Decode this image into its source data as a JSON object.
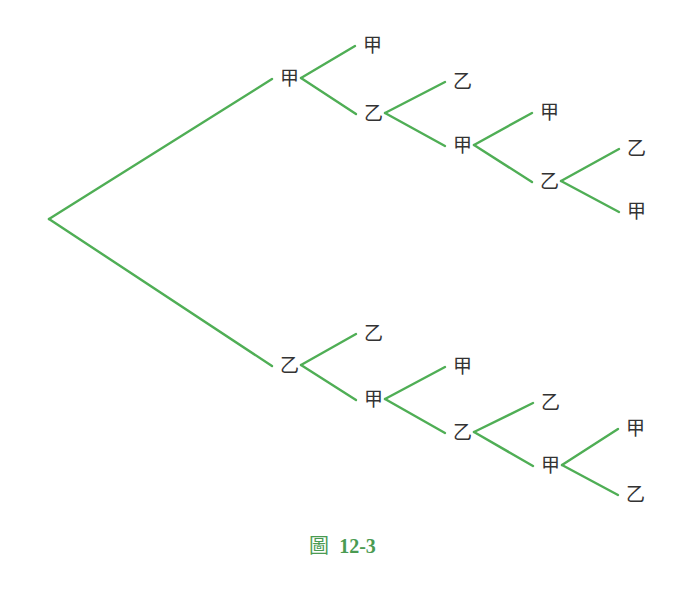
{
  "diagram": {
    "type": "tree-diagram",
    "edge_color": "#4fae55",
    "label_color": "#333333",
    "caption": {
      "prefix": "圖",
      "number": "12-3",
      "color": "#4a9b52"
    },
    "root": {
      "x": 49,
      "y": 219
    },
    "nodes": [
      {
        "id": "a",
        "label": "甲",
        "x": 289,
        "y": 78,
        "parent": "root"
      },
      {
        "id": "aa",
        "label": "甲",
        "x": 372,
        "y": 45,
        "parent": "a"
      },
      {
        "id": "ab",
        "label": "乙",
        "x": 373,
        "y": 113,
        "parent": "a"
      },
      {
        "id": "aba",
        "label": "乙",
        "x": 462,
        "y": 81,
        "parent": "ab"
      },
      {
        "id": "abb",
        "label": "甲",
        "x": 462,
        "y": 145,
        "parent": "ab"
      },
      {
        "id": "abba",
        "label": "甲",
        "x": 549,
        "y": 112,
        "parent": "abb"
      },
      {
        "id": "abbb",
        "label": "乙",
        "x": 549,
        "y": 181,
        "parent": "abb"
      },
      {
        "id": "abbba",
        "label": "乙",
        "x": 636,
        "y": 148,
        "parent": "abbb"
      },
      {
        "id": "abbbb",
        "label": "甲",
        "x": 636,
        "y": 211,
        "parent": "abbb"
      },
      {
        "id": "b",
        "label": "乙",
        "x": 289,
        "y": 365,
        "parent": "root"
      },
      {
        "id": "ba",
        "label": "乙",
        "x": 373,
        "y": 333,
        "parent": "b"
      },
      {
        "id": "bb",
        "label": "甲",
        "x": 373,
        "y": 399,
        "parent": "b"
      },
      {
        "id": "bba",
        "label": "甲",
        "x": 462,
        "y": 366,
        "parent": "bb"
      },
      {
        "id": "bbb",
        "label": "乙",
        "x": 462,
        "y": 432,
        "parent": "bb"
      },
      {
        "id": "bbba",
        "label": "乙",
        "x": 550,
        "y": 402,
        "parent": "bbb"
      },
      {
        "id": "bbbb",
        "label": "甲",
        "x": 550,
        "y": 465,
        "parent": "bbb"
      },
      {
        "id": "bbbba",
        "label": "甲",
        "x": 635,
        "y": 428,
        "parent": "bbbb"
      },
      {
        "id": "bbbbb",
        "label": "乙",
        "x": 635,
        "y": 494,
        "parent": "bbbb"
      }
    ]
  }
}
